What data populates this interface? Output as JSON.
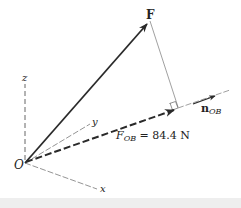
{
  "diagram": {
    "labels": {
      "force": "F",
      "unit_vector_main": "n",
      "unit_vector_sub": "OB",
      "projection_main": "F",
      "projection_sub": "OB",
      "projection_value": " = 84.4 N",
      "origin": "O",
      "axis_x": "x",
      "axis_y": "y",
      "axis_z": "z"
    },
    "colors": {
      "stroke": "#2a2a2a",
      "thin_line": "#777777",
      "background": "#ffffff"
    }
  }
}
